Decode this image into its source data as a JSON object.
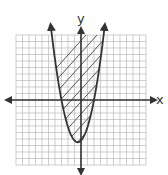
{
  "chart_data": {
    "type": "line",
    "title": "",
    "xlabel": "x",
    "ylabel": "y",
    "xlim": [
      -10,
      10
    ],
    "ylim": [
      -10,
      10
    ],
    "grid": true,
    "legend": null,
    "series": [
      {
        "name": "parabola boundary (solid)",
        "kind": "parabola",
        "vertex": [
          -0.5,
          -6.5
        ],
        "x_intercepts": [
          -3.2,
          2.0
        ],
        "points": [
          [
            -4.2,
            10
          ],
          [
            -3.2,
            0
          ],
          [
            -2,
            -4.8
          ],
          [
            -0.5,
            -6.5
          ],
          [
            1,
            -4.8
          ],
          [
            2,
            0
          ],
          [
            3.3,
            10
          ]
        ]
      }
    ],
    "shading": {
      "region": "inside parabola (above curve)",
      "pattern": "diagonal hatch"
    },
    "annotations": []
  },
  "labels": {
    "x_axis": "x",
    "y_axis": "y"
  },
  "colors": {
    "grid": "#b9b9b9",
    "axis": "#333333",
    "curve": "#333333",
    "hatch": "#555555"
  }
}
